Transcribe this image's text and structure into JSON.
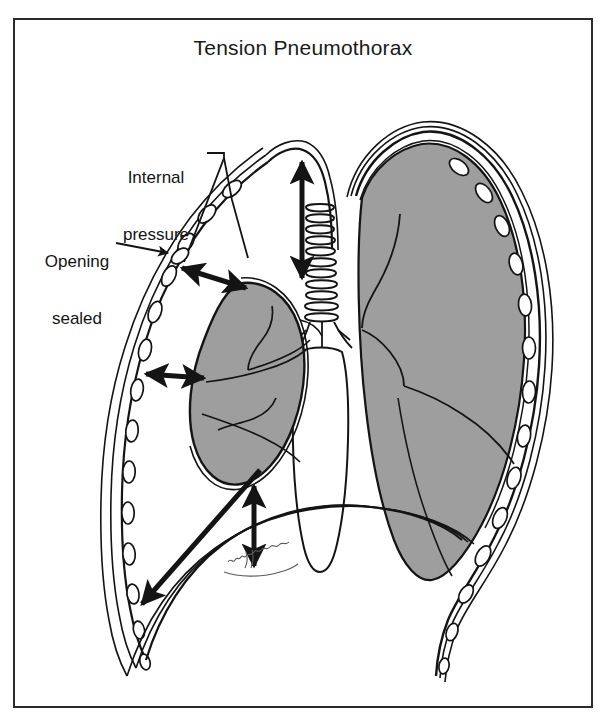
{
  "figure": {
    "title": "Tension Pneumothorax",
    "border_color": "#2b2b2b",
    "background_color": "#ffffff",
    "ink_color": "#141414",
    "lung_fill_color": "#9e9e9e",
    "rib_fill_color": "#ffffff"
  },
  "annotations": {
    "internal_pressure": {
      "line1": "Internal",
      "line2": "pressure",
      "text": "Internal pressure"
    },
    "opening_sealed": {
      "line1": "Opening",
      "line2": "sealed",
      "text": "Opening sealed"
    }
  },
  "anatomy": {
    "collapsed_lung_label": "collapsed left lung",
    "inflated_lung_label": "inflated right lung",
    "trachea_label": "trachea",
    "chest_wall_label": "chest wall with ribs",
    "diaphragm_label": "depressed diaphragm",
    "signature_label": "artist signature"
  },
  "arrows": {
    "apex_vertical": "internal pressure expanding apex",
    "upper_diagonal": "internal pressure toward chest wall",
    "mid_horizontal": "pressure compressing lung laterally",
    "lower_diagonal": "pressure toward costophrenic angle",
    "below_lung_vertical": "pressure compressing lung inferiorly",
    "diaphragm_down": "diaphragm pushed downward"
  }
}
